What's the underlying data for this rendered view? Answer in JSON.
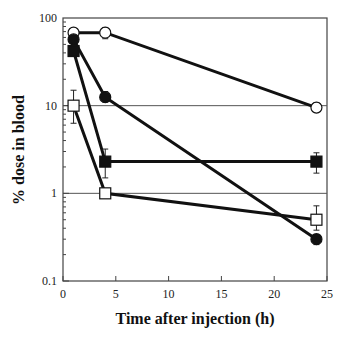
{
  "chart_data": {
    "type": "line",
    "title": "",
    "xlabel": "Time after injection (h)",
    "ylabel": "% dose in blood",
    "xlim": [
      0,
      25
    ],
    "ylim": [
      0.1,
      100
    ],
    "yscale": "log",
    "xticks": [
      0,
      5,
      10,
      15,
      20,
      25
    ],
    "xtick_labels": [
      "0",
      "5",
      "10",
      "15",
      "20",
      "25"
    ],
    "yticks": [
      0.1,
      1,
      10,
      100
    ],
    "ytick_labels": [
      "0.1",
      "1",
      "10",
      "100"
    ],
    "grid": "horizontal lines at 1 and 10",
    "legend": "none",
    "x": [
      1,
      4,
      24
    ],
    "series": [
      {
        "name": "open circle",
        "marker": "circle-open",
        "values": [
          68,
          68,
          9.5
        ],
        "err_low": [
          null,
          58,
          8.5
        ],
        "err_high": [
          null,
          78,
          10.8
        ]
      },
      {
        "name": "filled circle",
        "marker": "circle-filled",
        "values": [
          57,
          12.5,
          0.3
        ],
        "err_low": [
          null,
          11,
          0.26
        ],
        "err_high": [
          null,
          14.5,
          0.34
        ]
      },
      {
        "name": "filled square",
        "marker": "square-filled",
        "values": [
          42,
          2.3,
          2.3
        ],
        "err_low": [
          null,
          1.5,
          1.7
        ],
        "err_high": [
          null,
          3.2,
          2.9
        ]
      },
      {
        "name": "open square",
        "marker": "square-open",
        "values": [
          10,
          1.0,
          0.5
        ],
        "err_low": [
          6.3,
          null,
          0.38
        ],
        "err_high": [
          15,
          null,
          0.72
        ]
      }
    ]
  }
}
